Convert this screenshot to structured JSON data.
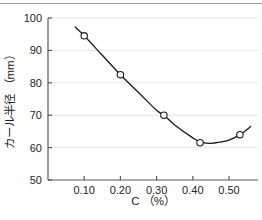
{
  "chart_data": {
    "type": "line",
    "title": "",
    "xlabel": "C （%）",
    "ylabel": "カール半径 （mm）",
    "xlim": [
      0.0,
      0.58
    ],
    "ylim": [
      50,
      100
    ],
    "xticks": [
      0.1,
      0.2,
      0.3,
      0.4,
      0.5
    ],
    "xtick_labels": [
      "0.10",
      "0.20",
      "0.30",
      "0.40",
      "0.50"
    ],
    "yticks": [
      50,
      60,
      70,
      80,
      90,
      100
    ],
    "ytick_labels": [
      "50",
      "60",
      "70",
      "80",
      "90",
      "100"
    ],
    "grid": "horizontal",
    "legend": "none",
    "marker": "open-circle",
    "series": [
      {
        "name": "カール半径",
        "x": [
          0.1,
          0.2,
          0.32,
          0.42,
          0.53
        ],
        "values": [
          94.5,
          82.5,
          70.0,
          61.5,
          64.0
        ]
      }
    ],
    "curve_x": [
      0.075,
      0.1,
      0.15,
      0.2,
      0.25,
      0.3,
      0.32,
      0.35,
      0.4,
      0.42,
      0.45,
      0.48,
      0.5,
      0.53,
      0.56
    ],
    "curve_y": [
      97.2,
      94.5,
      88.5,
      82.5,
      77.0,
      71.5,
      70.0,
      67.0,
      63.0,
      61.8,
      61.3,
      61.8,
      62.3,
      64.0,
      66.5
    ]
  },
  "colors": {
    "axis": "#595959",
    "grid": "#e8e4ea",
    "line": "#1a1a1a",
    "marker_fill": "#ffffff",
    "marker_stroke": "#1a1a1a",
    "text": "#231f20",
    "top_rule": "#9a9a9a",
    "background": "#ffffff"
  }
}
